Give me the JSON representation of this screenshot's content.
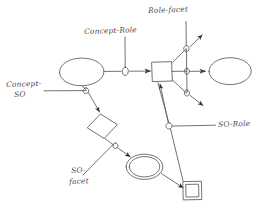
{
  "diagram": {
    "style": "hand-drawn sketch, black ink on white",
    "stroke_color": "#555555",
    "background_color": "#ffffff",
    "labels": {
      "concept_role": "Concept-Role",
      "role_facet": "Role-facet",
      "concept_so_line1": "Concept-",
      "concept_so_line2": "SO",
      "so_role": "SO-Role",
      "so_facet_line1": "SO-",
      "so_facet_line2": "facet"
    },
    "nodes": [
      {
        "name": "left-ellipse",
        "shape": "ellipse",
        "label": ""
      },
      {
        "name": "center-rectangle",
        "shape": "rectangle",
        "label": ""
      },
      {
        "name": "right-ellipse",
        "shape": "ellipse",
        "label": ""
      },
      {
        "name": "diamond",
        "shape": "diamond",
        "label": ""
      },
      {
        "name": "double-ellipse",
        "shape": "double-ellipse",
        "label": ""
      },
      {
        "name": "double-square",
        "shape": "double-square",
        "label": ""
      }
    ],
    "connector_markers": [
      {
        "name": "concept-role-marker",
        "shape": "small-ellipse"
      },
      {
        "name": "role-facet-marker",
        "shape": "small-circle"
      },
      {
        "name": "role-facet-marker-mid",
        "shape": "small-circle"
      },
      {
        "name": "role-facet-marker-low",
        "shape": "small-circle"
      },
      {
        "name": "concept-so-marker",
        "shape": "small-circle"
      },
      {
        "name": "so-facet-marker",
        "shape": "small-circle"
      },
      {
        "name": "so-role-marker",
        "shape": "small-ellipse"
      }
    ],
    "arrows": [
      {
        "name": "arrow-into-rectangle",
        "direction": "right"
      },
      {
        "name": "arrow-into-right-ellipse",
        "direction": "right"
      },
      {
        "name": "arrow-up-right-facet",
        "direction": "up-right"
      },
      {
        "name": "arrow-down-right-facet",
        "direction": "down-right"
      },
      {
        "name": "arrow-into-diamond",
        "direction": "down-right"
      },
      {
        "name": "arrow-into-double-ellipse",
        "direction": "down-right"
      },
      {
        "name": "arrow-into-double-square",
        "direction": "down-right"
      },
      {
        "name": "arrow-into-rectangle-from-below",
        "direction": "up-right"
      }
    ]
  }
}
